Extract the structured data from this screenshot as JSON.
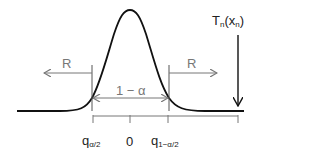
{
  "diagram": {
    "curve": "normal-density",
    "acceptance_label": "1 − α",
    "rejection_left_label": "R",
    "rejection_right_label": "R",
    "statistic_label": {
      "main": "T",
      "sub1": "n",
      "mid": "(x",
      "sub2": "n",
      "end": ")"
    },
    "axis_ticks": [
      {
        "main": "q",
        "sub": "α/2"
      },
      {
        "main": "0",
        "sub": ""
      },
      {
        "main": "q",
        "sub": "1−α/2"
      }
    ],
    "colors": {
      "curve": "#111111",
      "annotation": "#777777",
      "axis": "#777777"
    }
  }
}
